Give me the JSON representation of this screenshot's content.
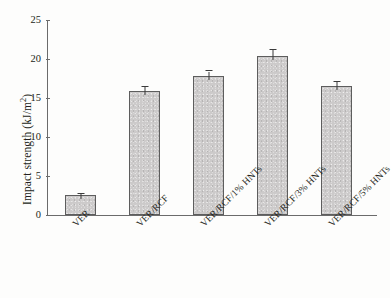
{
  "chart_data": {
    "type": "bar",
    "title": "",
    "xlabel": "",
    "ylabel": "Impact strength (kJ/m2)",
    "ylabel_main": "Impact strength (kJ/m",
    "ylabel_sup": "2",
    "ylabel_tail": ")",
    "categories": [
      "VER",
      "VER/RCF",
      "VER/RCF/1% HNTs",
      "VER/RCF/3% HNTs",
      "VER/RCF/5% HNTs"
    ],
    "values": [
      2.6,
      15.9,
      17.8,
      20.4,
      16.5
    ],
    "errors": [
      0.15,
      0.5,
      0.6,
      0.7,
      0.5
    ],
    "ylim": [
      0,
      25
    ],
    "yticks": [
      0,
      5,
      10,
      15,
      20,
      25
    ],
    "ytick_labels": [
      "0",
      "5",
      "10",
      "15",
      "20",
      "25"
    ],
    "grid": false,
    "legend": null,
    "bar_color": "#cccaca",
    "bar_edge_color": "#5d5d5d",
    "axis_color": "#6b6b6b",
    "text_color": "#231f20",
    "background": "#ffffff"
  }
}
